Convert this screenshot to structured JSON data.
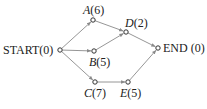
{
  "diagram": {
    "type": "activity-network",
    "colors": {
      "edge": "#8a8a8a",
      "node_stroke": "#333333",
      "text": "#222222"
    },
    "nodes": [
      {
        "id": "START",
        "name": "START",
        "value": "(0)",
        "x": 60,
        "y": 50
      },
      {
        "id": "A",
        "name": "A",
        "value": "(6)",
        "x": 93,
        "y": 20
      },
      {
        "id": "B",
        "name": "B",
        "value": "(5)",
        "x": 94,
        "y": 51
      },
      {
        "id": "C",
        "name": "C",
        "value": "(7)",
        "x": 95,
        "y": 82
      },
      {
        "id": "D",
        "name": "D",
        "value": "(2)",
        "x": 126,
        "y": 32
      },
      {
        "id": "E",
        "name": "E",
        "value": "(5)",
        "x": 128,
        "y": 82
      },
      {
        "id": "END",
        "name": "END",
        "value": "(0)",
        "x": 158,
        "y": 48
      }
    ],
    "edges": [
      {
        "from": "START",
        "to": "A"
      },
      {
        "from": "START",
        "to": "B"
      },
      {
        "from": "START",
        "to": "C"
      },
      {
        "from": "A",
        "to": "D"
      },
      {
        "from": "B",
        "to": "D"
      },
      {
        "from": "D",
        "to": "END"
      },
      {
        "from": "C",
        "to": "E"
      },
      {
        "from": "E",
        "to": "END"
      }
    ],
    "labels": {
      "start": "START(0)",
      "a_name": "A",
      "a_val": "(6)",
      "b_name": "B",
      "b_val": "(5)",
      "c_name": "C",
      "c_val": "(7)",
      "d_name": "D",
      "d_val": "(2)",
      "e_name": "E",
      "e_val": "(5)",
      "end": "END (0)"
    }
  }
}
